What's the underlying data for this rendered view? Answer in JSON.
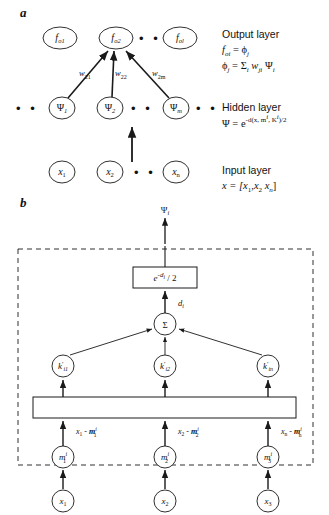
{
  "figure": {
    "panel_a_label": "a",
    "panel_b_label": "b"
  },
  "panel_a": {
    "output_nodes": [
      {
        "base": "f",
        "sub": "o1"
      },
      {
        "base": "f",
        "sub": "o2"
      },
      {
        "base": "f",
        "sub": "ol"
      }
    ],
    "hidden_nodes": [
      {
        "base": "Ψ",
        "sub": "1"
      },
      {
        "base": "Ψ",
        "sub": "2"
      },
      {
        "base": "Ψ",
        "sub": "m"
      }
    ],
    "input_nodes": [
      {
        "base": "x",
        "sub": "1"
      },
      {
        "base": "x",
        "sub": "2"
      },
      {
        "base": "x",
        "sub": "n"
      }
    ],
    "weights": [
      {
        "base": "w",
        "sub": "21"
      },
      {
        "base": "w",
        "sub": "22"
      },
      {
        "base": "w",
        "sub": "2m"
      }
    ],
    "ellipsis": "•  •",
    "legend": {
      "output_title": "Output layer",
      "output_eq1_left": "f",
      "output_eq1_left_sub": "oi",
      "output_eq1_right": " = ϕ",
      "output_eq1_right_sub": "j",
      "output_eq2": "ϕ",
      "output_eq2_sub": "j",
      "output_eq2_rest": " = Σ",
      "output_eq2_sub2": "i",
      "output_eq2_w": " w",
      "output_eq2_w_sub": "ji",
      "output_eq2_psi": " Ψ",
      "output_eq2_psi_sub": "i",
      "hidden_title": "Hidden layer",
      "hidden_eq_lead": "Ψ = e",
      "hidden_eq_exp_minus": "-d(x, m",
      "hidden_eq_exp_i1": "i",
      "hidden_eq_exp_mid": ", K",
      "hidden_eq_exp_i2": "i",
      "hidden_eq_exp_tail": ")/2",
      "input_title": "Input layer",
      "input_eq": "x = [x",
      "input_eq_sub1": "1",
      "input_eq_mid": ",x",
      "input_eq_sub2": "2",
      "input_eq_dots": "    x",
      "input_eq_sub3": "n",
      "input_eq_close": "]"
    }
  },
  "panel_b": {
    "output_symbol": "Ψ",
    "output_symbol_sub": "i",
    "gaussian_box": {
      "lead": "e",
      "exp_minus": "-d",
      "exp_sub": "i",
      "tail": " / 2"
    },
    "distance_label": "d",
    "distance_label_sub": "i",
    "sum_node": "Σ",
    "k_nodes": [
      {
        "base": "k",
        "prime": "′",
        "sub": "i1"
      },
      {
        "base": "k",
        "prime": "′",
        "sub": "i2"
      },
      {
        "base": "k",
        "prime": "′",
        "sub": "in"
      }
    ],
    "difference_labels": [
      {
        "x": "x",
        "x_sub": "1",
        "op": " - ",
        "m": "m",
        "m_sub": "1",
        "m_sup": "i"
      },
      {
        "x": "x",
        "x_sub": "2",
        "op": " - ",
        "m": "m",
        "m_sub": "2",
        "m_sup": "i"
      },
      {
        "x": "x",
        "x_sub": "n",
        "op": " - ",
        "m": "m",
        "m_sub": "n",
        "m_sup": "i"
      }
    ],
    "mean_nodes": [
      {
        "base": "m",
        "sub": "1",
        "sup": "i"
      },
      {
        "base": "m",
        "sub": "2",
        "sup": "i"
      },
      {
        "base": "m",
        "sub": "3",
        "sup": "i"
      }
    ],
    "input_nodes": [
      {
        "base": "x",
        "sub": "1"
      },
      {
        "base": "x",
        "sub": "2"
      },
      {
        "base": "x",
        "sub": "3"
      }
    ]
  },
  "style": {
    "stroke": "#1a1a1a",
    "background": "#ffffff",
    "dash": "5,4"
  }
}
